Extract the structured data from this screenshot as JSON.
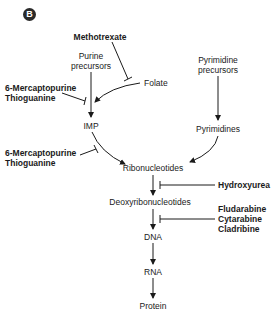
{
  "panel_label": "B",
  "nodes": {
    "purine_precursors": [
      "Purine",
      "precursors"
    ],
    "folate": "Folate",
    "pyrimidine_precursors": [
      "Pyrimidine",
      "precursors"
    ],
    "imp": "IMP",
    "pyrimidines": "Pyrimidines",
    "ribonucleotides": "Ribonucleotides",
    "deoxyribonucleotides": "Deoxyribonucleotides",
    "dna": "DNA",
    "rna": "RNA",
    "protein": "Protein"
  },
  "inhibitors": {
    "methotrexate": "Methotrexate",
    "mercaptopurine_1": [
      "6-Mercaptopurine",
      "Thioguanine"
    ],
    "mercaptopurine_2": [
      "6-Mercaptopurine",
      "Thioguanine"
    ],
    "hydroxyurea": "Hydroxyurea",
    "nucleoside_analogs": [
      "Fludarabine",
      "Cytarabine",
      "Cladribine"
    ]
  }
}
